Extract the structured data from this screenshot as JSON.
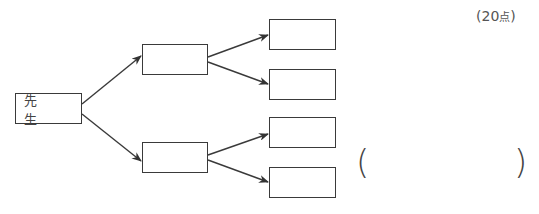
{
  "score": {
    "open": "(",
    "value": "20",
    "unit": "点",
    "close": ")"
  },
  "tree": {
    "root": {
      "label": "先 生"
    },
    "level1": [
      {
        "label": ""
      },
      {
        "label": ""
      }
    ],
    "level2": [
      {
        "label": ""
      },
      {
        "label": ""
      },
      {
        "label": ""
      },
      {
        "label": ""
      }
    ]
  },
  "answer": {
    "open_paren": "(",
    "value": "",
    "close_paren": ")"
  }
}
